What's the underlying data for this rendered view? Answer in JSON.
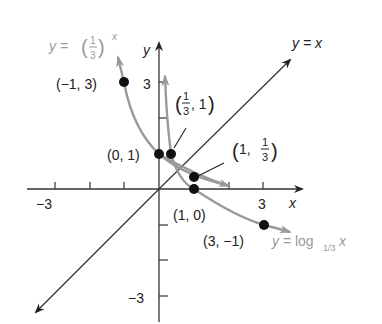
{
  "diagram": {
    "axes": {
      "x_label": "x",
      "y_label": "y",
      "x_tick_labels": {
        "neg": "−3",
        "pos": "3"
      },
      "y_tick_labels": {
        "pos": "3",
        "neg": "−3"
      },
      "range": [
        -3,
        3
      ]
    },
    "curves": [
      {
        "name": "exponential",
        "label_prefix": "y = ",
        "label_base_num": "1",
        "label_base_den": "3",
        "label_exp": "x",
        "color": "#9a9a9a"
      },
      {
        "name": "logarithmic",
        "label_prefix": "y = log",
        "label_sub": "1/3",
        "label_var": "x",
        "color": "#9a9a9a"
      },
      {
        "name": "identity",
        "label": "y = x",
        "color": "#333333"
      }
    ],
    "points": [
      {
        "label": "(−1, 3)",
        "x": -1,
        "y": 3
      },
      {
        "label": "(0, 1)",
        "x": 0,
        "y": 1
      },
      {
        "label_parts": [
          "1",
          "3",
          ", 1"
        ],
        "x": 0.3333,
        "y": 1,
        "text": "(1/3, 1)"
      },
      {
        "label_parts": [
          "1, ",
          "1",
          "3"
        ],
        "x": 1,
        "y": 0.3333,
        "text": "(1, 1/3)"
      },
      {
        "label": "(1, 0)",
        "x": 1,
        "y": 0
      },
      {
        "label": "(3, −1)",
        "x": 3,
        "y": -1
      }
    ]
  }
}
